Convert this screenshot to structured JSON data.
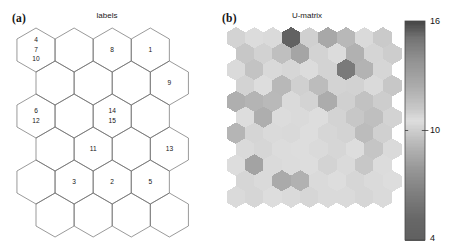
{
  "figure": {
    "width": 455,
    "height": 252,
    "background": "#ffffff"
  },
  "panel_a": {
    "tag": "(a)",
    "title": "labels",
    "grid": {
      "type": "hexagonal",
      "orientation": "pointy-top",
      "columns": 5,
      "rows": 6,
      "outline_color": "#6e6e6e",
      "fill_color": "#ffffff"
    },
    "cells": [
      {
        "row": 0,
        "col": 0,
        "labels": [
          "4",
          "7",
          "10"
        ]
      },
      {
        "row": 0,
        "col": 1,
        "labels": []
      },
      {
        "row": 0,
        "col": 2,
        "labels": [
          "8"
        ]
      },
      {
        "row": 0,
        "col": 3,
        "labels": [
          "1"
        ]
      },
      {
        "row": 1,
        "col": 0,
        "labels": []
      },
      {
        "row": 1,
        "col": 1,
        "labels": []
      },
      {
        "row": 1,
        "col": 2,
        "labels": []
      },
      {
        "row": 1,
        "col": 3,
        "labels": [
          "9"
        ]
      },
      {
        "row": 2,
        "col": 0,
        "labels": [
          "6",
          "12"
        ]
      },
      {
        "row": 2,
        "col": 1,
        "labels": []
      },
      {
        "row": 2,
        "col": 2,
        "labels": [
          "14",
          "15"
        ]
      },
      {
        "row": 2,
        "col": 3,
        "labels": []
      },
      {
        "row": 3,
        "col": 0,
        "labels": []
      },
      {
        "row": 3,
        "col": 1,
        "labels": [
          "11"
        ]
      },
      {
        "row": 3,
        "col": 2,
        "labels": []
      },
      {
        "row": 3,
        "col": 3,
        "labels": [
          "13"
        ]
      },
      {
        "row": 4,
        "col": 0,
        "labels": []
      },
      {
        "row": 4,
        "col": 1,
        "labels": [
          "3"
        ]
      },
      {
        "row": 4,
        "col": 2,
        "labels": [
          "2"
        ]
      },
      {
        "row": 4,
        "col": 3,
        "labels": [
          "5"
        ]
      },
      {
        "row": 5,
        "col": 0,
        "labels": []
      },
      {
        "row": 5,
        "col": 1,
        "labels": []
      },
      {
        "row": 5,
        "col": 2,
        "labels": []
      },
      {
        "row": 5,
        "col": 3,
        "labels": []
      }
    ]
  },
  "panel_b": {
    "tag": "(b)",
    "title": "U-matrix",
    "grid": {
      "type": "hexagonal",
      "orientation": "pointy-top",
      "columns": 9,
      "rows": 11
    },
    "colorbar": {
      "min": 4,
      "max": 16,
      "ticks": [
        {
          "value": "16",
          "position": 1.0
        },
        {
          "value": "10",
          "position": 0.5
        },
        {
          "value": "4",
          "position": 0.0
        }
      ]
    }
  },
  "chart_data": {
    "type": "heatmap",
    "title": "U-matrix",
    "xlabel": "",
    "ylabel": "",
    "colorbar_label": "",
    "zlim": [
      4,
      16
    ],
    "grid": "hexagonal",
    "legend_position": "right",
    "note": "Self-organising map. Panel (a) shows cluster labels per map unit; panel (b) shows the unified distance matrix in greyscale.",
    "values": [
      [
        10.2,
        10.6,
        10.4,
        15.4,
        10.1,
        12.6,
        11.9,
        10.4,
        9.9
      ],
      [
        9.8,
        10.9,
        11.6,
        12.8,
        10.2,
        10.6,
        12.2,
        10.8,
        10.0
      ],
      [
        10.4,
        11.4,
        10.7,
        10.3,
        10.6,
        10.2,
        14.8,
        12.1,
        10.3
      ],
      [
        10.2,
        10.5,
        11.9,
        10.1,
        9.4,
        10.2,
        10.9,
        10.4,
        9.8
      ],
      [
        8.9,
        9.1,
        9.3,
        10.4,
        10.2,
        12.4,
        10.1,
        9.6,
        10.0
      ],
      [
        10.5,
        12.3,
        10.6,
        10.4,
        10.5,
        10.2,
        9.8,
        9.5,
        10.2
      ],
      [
        12.0,
        10.8,
        10.4,
        10.7,
        10.5,
        10.3,
        10.2,
        9.4,
        10.1
      ],
      [
        10.4,
        10.3,
        10.6,
        10.5,
        10.4,
        10.3,
        10.5,
        9.7,
        10.4
      ],
      [
        10.5,
        12.9,
        10.4,
        10.6,
        10.5,
        10.2,
        10.4,
        9.8,
        10.6
      ],
      [
        10.3,
        10.4,
        12.5,
        12.2,
        10.4,
        10.5,
        10.3,
        10.4,
        10.5
      ],
      [
        10.4,
        10.3,
        10.5,
        10.4,
        10.3,
        10.4,
        10.4,
        10.3,
        10.4
      ]
    ]
  }
}
